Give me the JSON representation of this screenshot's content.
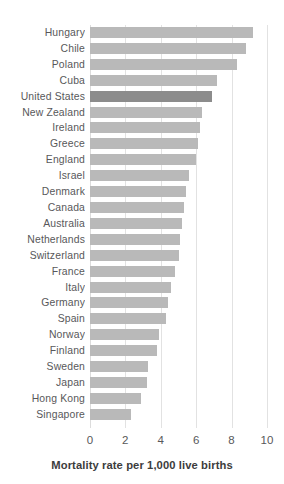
{
  "chart_data": {
    "type": "bar",
    "orientation": "horizontal",
    "title": "",
    "xlabel": "Mortality rate per 1,000 live births",
    "ylabel": "",
    "xlim": [
      0,
      10
    ],
    "xticks": [
      0,
      2,
      4,
      6,
      8,
      10
    ],
    "xtick_labels": [
      "0",
      "2",
      "4",
      "6",
      "8",
      "10"
    ],
    "grid": true,
    "legend": "none",
    "highlight_category": "United States",
    "bar_color": "#b9b9b9",
    "highlight_color": "#8c8c8c",
    "background_color": "#ffffff",
    "categories": [
      "Hungary",
      "Chile",
      "Poland",
      "Cuba",
      "United States",
      "New Zealand",
      "Ireland",
      "Greece",
      "England",
      "Israel",
      "Denmark",
      "Canada",
      "Australia",
      "Netherlands",
      "Switzerland",
      "France",
      "Italy",
      "Germany",
      "Spain",
      "Norway",
      "Finland",
      "Sweden",
      "Japan",
      "Hong Kong",
      "Singapore"
    ],
    "values": [
      9.2,
      8.8,
      8.3,
      7.2,
      6.9,
      6.3,
      6.2,
      6.1,
      6.0,
      5.6,
      5.4,
      5.3,
      5.2,
      5.1,
      5.0,
      4.8,
      4.6,
      4.4,
      4.3,
      3.9,
      3.8,
      3.3,
      3.2,
      2.9,
      2.3
    ]
  }
}
